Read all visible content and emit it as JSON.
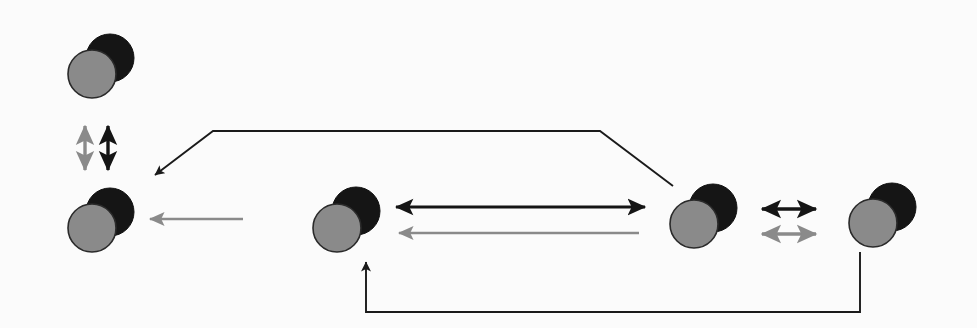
{
  "diagram": {
    "canvas": {
      "width": 977,
      "height": 328,
      "background": "#fbfbfb"
    },
    "palette": {
      "dark": "#151515",
      "gray": "#8a8a8a",
      "outline": "#2a2a2a",
      "line_dark": "#1a1a1a",
      "line_gray": "#8c8c8c"
    },
    "node_label": "dumbbell-pair",
    "nodes": [
      {
        "id": "pair-1",
        "name": "pair-top-left",
        "gray_cx": 92,
        "gray_cy": 74,
        "dark_cx": 110,
        "dark_cy": 58,
        "r": 24
      },
      {
        "id": "pair-2",
        "name": "pair-left",
        "gray_cx": 92,
        "gray_cy": 228,
        "dark_cx": 110,
        "dark_cy": 212,
        "r": 24
      },
      {
        "id": "pair-3",
        "name": "pair-center-left",
        "gray_cx": 337,
        "gray_cy": 228,
        "dark_cx": 356,
        "dark_cy": 211,
        "r": 24
      },
      {
        "id": "pair-4",
        "name": "pair-center-right",
        "gray_cx": 694,
        "gray_cy": 224,
        "dark_cx": 713,
        "dark_cy": 208,
        "r": 24
      },
      {
        "id": "pair-5",
        "name": "pair-right",
        "gray_cx": 873,
        "gray_cy": 223,
        "dark_cx": 892,
        "dark_cy": 207,
        "r": 24
      }
    ],
    "connectors": [
      {
        "id": "arrow-vertical-gray",
        "name": "vertical-double-arrow-gray",
        "color": "gray",
        "style": "double",
        "orientation": "vertical",
        "from": "pair-1",
        "to": "pair-2"
      },
      {
        "id": "arrow-vertical-black",
        "name": "vertical-double-arrow-black",
        "color": "dark",
        "style": "double",
        "orientation": "vertical",
        "from": "pair-1",
        "to": "pair-2"
      },
      {
        "id": "arrow-left-gray",
        "name": "left-arrow-gray",
        "color": "gray",
        "style": "single",
        "orientation": "horizontal",
        "from": "pair-3",
        "to": "pair-2"
      },
      {
        "id": "arrow-mid-black-double",
        "name": "center-double-arrow-black",
        "color": "dark",
        "style": "double",
        "orientation": "horizontal",
        "from": "pair-3",
        "to": "pair-4"
      },
      {
        "id": "arrow-mid-gray-left",
        "name": "center-left-arrow-gray",
        "color": "gray",
        "style": "single",
        "orientation": "horizontal",
        "from": "pair-4",
        "to": "pair-3"
      },
      {
        "id": "arrow-right-black-double",
        "name": "right-double-arrow-black",
        "color": "dark",
        "style": "double",
        "orientation": "horizontal",
        "from": "pair-4",
        "to": "pair-5"
      },
      {
        "id": "arrow-right-gray-double",
        "name": "right-double-arrow-gray",
        "color": "gray",
        "style": "double",
        "orientation": "horizontal",
        "from": "pair-4",
        "to": "pair-5"
      },
      {
        "id": "path-top",
        "name": "top-polyline-arrow",
        "color": "dark",
        "style": "single",
        "orientation": "polyline",
        "from": "pair-4",
        "to": "pair-2"
      },
      {
        "id": "path-bottom",
        "name": "bottom-polyline-arrow",
        "color": "dark",
        "style": "single",
        "orientation": "polyline",
        "from": "pair-5",
        "to": "pair-3"
      }
    ]
  },
  "geometry": {
    "vertical_gray": {
      "x": 85,
      "y1": 124,
      "y2": 172
    },
    "vertical_black": {
      "x": 108,
      "y1": 124,
      "y2": 172
    },
    "left_gray_arrow": {
      "x1": 243,
      "x2": 146,
      "y": 219
    },
    "mid_black_double": {
      "x1": 393,
      "x2": 648,
      "y": 207
    },
    "mid_gray_left": {
      "x1": 639,
      "x2": 396,
      "y": 233
    },
    "right_black_double": {
      "x1": 757,
      "x2": 820,
      "y": 209
    },
    "right_gray_double": {
      "x1": 757,
      "x2": 820,
      "y": 234
    },
    "top_path": "M 673,186 L 600,131 L 213,131 L 155,175",
    "bottom_path": "M 860,252 L 860,312 L 366,312 L 366,262"
  }
}
